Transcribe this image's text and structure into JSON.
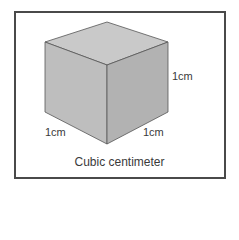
{
  "diagram": {
    "title": "Cubic centimeter",
    "labels": {
      "height": "1cm",
      "left_edge": "1cm",
      "right_edge": "1cm"
    },
    "colors": {
      "frame_border": "#4a4a4a",
      "top_face": "#c8c8c8",
      "left_face": "#bdbdbd",
      "right_face": "#b0b0b0",
      "edge": "#555555"
    }
  }
}
